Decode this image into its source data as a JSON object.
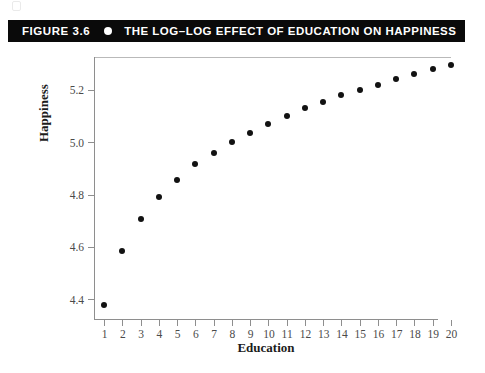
{
  "banner": {
    "figure_number": "FIGURE 3.6",
    "bullet_icon": "filled-circle-icon",
    "title": "THE LOG–LOG EFFECT OF EDUCATION ON HAPPINESS",
    "background_color": "#0a0a0a",
    "text_color": "#ffffff"
  },
  "chart_data": {
    "type": "scatter",
    "title": "THE LOG–LOG EFFECT OF EDUCATION ON HAPPINESS",
    "xlabel": "Education",
    "ylabel": "Happiness",
    "x": [
      1,
      2,
      3,
      4,
      5,
      6,
      7,
      8,
      9,
      10,
      11,
      12,
      13,
      14,
      15,
      16,
      17,
      18,
      19,
      20
    ],
    "values": [
      4.38,
      4.585,
      4.705,
      4.79,
      4.855,
      4.915,
      4.96,
      5.0,
      5.035,
      5.07,
      5.1,
      5.13,
      5.155,
      5.18,
      5.2,
      5.22,
      5.24,
      5.26,
      5.28,
      5.295
    ],
    "xlim": [
      0.45,
      20.0
    ],
    "ylim": [
      4.325,
      5.325
    ],
    "xticks": [
      1,
      2,
      3,
      4,
      5,
      6,
      7,
      8,
      9,
      10,
      11,
      12,
      13,
      14,
      15,
      16,
      17,
      18,
      19,
      20
    ],
    "xtick_labels": [
      "1",
      "2",
      "3",
      "4",
      "5",
      "6",
      "7",
      "8",
      "9",
      "10",
      "11",
      "12",
      "13",
      "14",
      "15",
      "16",
      "17",
      "18",
      "19",
      "20"
    ],
    "yticks": [
      4.4,
      4.6,
      4.8,
      5.0,
      5.2
    ],
    "ytick_labels": [
      "4.4",
      "4.6",
      "4.8",
      "5.0",
      "5.2"
    ],
    "grid": false,
    "legend": null,
    "marker_color": "#121212",
    "axis_color": "#8e8e8e"
  }
}
